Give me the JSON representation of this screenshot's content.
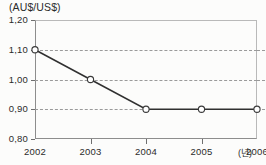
{
  "chart_data": {
    "type": "line",
    "title": "",
    "subtitle": "",
    "xlabel": "(년)",
    "ylabel": "(AU$/US$)",
    "unit_label": "(AU$/US$)",
    "x_unit_label": "(년)",
    "categories": [
      "2002",
      "2003",
      "2004",
      "2005",
      "2006"
    ],
    "values": [
      1.1,
      1.0,
      0.9,
      0.9,
      0.9
    ],
    "value_labels": [
      "1,10",
      "1,00",
      "0,90",
      "0,90",
      "0,90"
    ],
    "series": [
      {
        "name": "AU$/US$ exchange rate",
        "values": [
          1.1,
          1.0,
          0.9,
          0.9,
          0.9
        ]
      }
    ],
    "ylim": [
      0.8,
      1.2
    ],
    "yticks": [
      0.8,
      0.9,
      1.0,
      1.1,
      1.2
    ],
    "ytick_labels": [
      "0,80",
      "0,90",
      "1,00",
      "1,10",
      "1,20"
    ],
    "xtick_labels": [
      "2002",
      "2003",
      "2004",
      "2005",
      "2006"
    ],
    "grid": true,
    "grid_axis": "y",
    "grid_style": "dashed",
    "legend": false,
    "legend_position": "none",
    "marker": "open-circle",
    "decimal_separator": ",",
    "colors": {
      "line": "#303030",
      "marker_fill": "#ffffff",
      "marker_stroke": "#3a3a3a",
      "grid": "#9a9a9a",
      "axis": "#8d8d8d",
      "text": "#2b2b2b",
      "background": "#fcfcfb"
    }
  }
}
